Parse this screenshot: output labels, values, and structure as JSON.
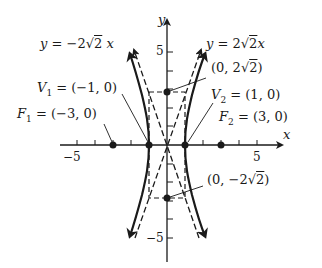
{
  "figure": {
    "type": "hyperbola-graph",
    "equation_implied": "x^2 - y^2/8 = 1",
    "axes": {
      "x_label": "x",
      "y_label": "y",
      "x_tick_label_neg": "−5",
      "x_tick_label_pos": "5",
      "y_tick_label_pos": "5",
      "y_tick_label_neg": "−5",
      "x_range": [
        -5,
        6
      ],
      "y_range": [
        -6,
        6
      ]
    },
    "asymptotes": {
      "negative": {
        "label": "y = −2√2 x",
        "y": "y = ",
        "coef": "−2",
        "rad": "2",
        "x": "x"
      },
      "positive": {
        "label": "y = 2√2 x",
        "y": "y = ",
        "coef": "2",
        "rad": "2",
        "x": "x"
      }
    },
    "points": {
      "V1": {
        "name": "V",
        "sub": "1",
        "value": " = (−1, 0)",
        "x": -1,
        "y": 0
      },
      "V2": {
        "name": "V",
        "sub": "2",
        "value": " = (1, 0)",
        "x": 1,
        "y": 0
      },
      "F1": {
        "name": "F",
        "sub": "1",
        "value": " = (−3, 0)",
        "x": -3,
        "y": 0
      },
      "F2": {
        "name": "F",
        "sub": "2",
        "value": " = (3, 0)",
        "x": 3,
        "y": 0
      },
      "B_top": {
        "label_pre": "(0, 2",
        "rad": "2",
        "label_post": ")",
        "x": 0,
        "y": 2.828
      },
      "B_bottom": {
        "label_pre": "(0, −2",
        "rad": "2",
        "label_post": ")",
        "x": 0,
        "y": -2.828
      }
    },
    "colors": {
      "ink": "#1a1a1a",
      "background": "#ffffff"
    }
  }
}
